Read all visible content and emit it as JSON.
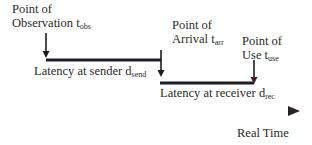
{
  "diagram": {
    "points": {
      "observation": {
        "line1": "Point of",
        "line2": "Observation t",
        "sub": "obs"
      },
      "arrival": {
        "line1": "Point of",
        "line2": "Arrival t",
        "sub": "arr"
      },
      "use": {
        "line1": "Point of",
        "line2": "Use t",
        "sub": "use"
      }
    },
    "latencies": {
      "sender": {
        "text": "Latency at sender d",
        "sub": "send"
      },
      "receiver": {
        "text": "Latency at receiver d",
        "sub": "rec"
      }
    },
    "axis": {
      "label": "Real Time"
    },
    "colors": {
      "line": "#1e1a22",
      "axis_tint": "#3a2a3a"
    }
  }
}
